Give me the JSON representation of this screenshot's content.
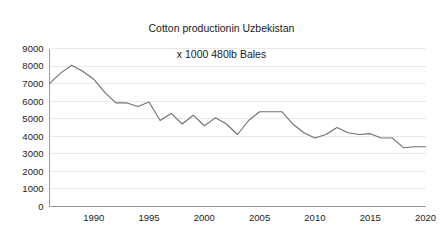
{
  "chart_data": {
    "type": "line",
    "title": "Cotton productionin Uzbekistan\nx 1000 480lb Bales",
    "title_line1": "Cotton productionin Uzbekistan",
    "title_line2": "x 1000 480lb Bales",
    "xlabel": "",
    "ylabel": "",
    "xlim": [
      1986,
      2020
    ],
    "ylim": [
      0,
      9000
    ],
    "grid": true,
    "legend": false,
    "legend_position": "none",
    "yticks": [
      0,
      1000,
      2000,
      3000,
      4000,
      5000,
      6000,
      7000,
      8000,
      9000
    ],
    "ytick_labels": [
      "0",
      "1000",
      "2000",
      "3000",
      "4000",
      "5000",
      "6000",
      "7000",
      "8000",
      "9000"
    ],
    "xticks": [
      1990,
      1995,
      2000,
      2005,
      2010,
      2015,
      2020
    ],
    "xtick_labels": [
      "1990",
      "1995",
      "2000",
      "2005",
      "2010",
      "2015",
      "2020"
    ],
    "series_color": "#707070",
    "grid_color": "#e9e9e9",
    "axis_color": "#9a9a9a",
    "x": [
      1986,
      1987,
      1988,
      1989,
      1990,
      1991,
      1992,
      1993,
      1994,
      1995,
      1996,
      1997,
      1998,
      1999,
      2000,
      2001,
      2002,
      2003,
      2004,
      2005,
      2006,
      2007,
      2008,
      2009,
      2010,
      2011,
      2012,
      2013,
      2014,
      2015,
      2016,
      2017,
      2018,
      2019,
      2020
    ],
    "values": [
      7000,
      7600,
      8050,
      7700,
      7250,
      6500,
      5900,
      5900,
      5700,
      5950,
      4900,
      5300,
      4700,
      5200,
      4600,
      5050,
      4700,
      4100,
      4900,
      5400,
      5400,
      5400,
      4700,
      4200,
      3900,
      4100,
      4500,
      4200,
      4100,
      4150,
      3900,
      3900,
      3350,
      3400,
      3400
    ]
  }
}
